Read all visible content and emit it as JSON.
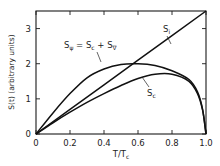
{
  "chart_data": {
    "type": "line",
    "title": "",
    "xlabel": "T/Tc",
    "ylabel": "S(t) (arbitrary units)",
    "xlim": [
      0,
      1.0
    ],
    "ylim": [
      0,
      3.5
    ],
    "grid": false,
    "x_ticks": [
      "0",
      "0.2",
      "0.4",
      "0.6",
      "0.8",
      "1.0"
    ],
    "y_ticks": [
      "0",
      "1",
      "2",
      "3"
    ],
    "series": [
      {
        "name": "Si",
        "x": [
          0,
          0.2,
          0.4,
          0.6,
          0.8,
          1.0
        ],
        "values": [
          0,
          0.7,
          1.4,
          2.1,
          2.8,
          3.5
        ]
      },
      {
        "name": "Sψ = Sc + S∇",
        "x": [
          0,
          0.1,
          0.2,
          0.3,
          0.4,
          0.5,
          0.6,
          0.7,
          0.8,
          0.9,
          0.95,
          0.98,
          1.0
        ],
        "values": [
          0,
          0.6,
          1.15,
          1.6,
          1.85,
          1.98,
          2.0,
          1.95,
          1.8,
          1.55,
          1.2,
          0.7,
          0
        ]
      },
      {
        "name": "Sc",
        "x": [
          0,
          0.1,
          0.2,
          0.3,
          0.4,
          0.5,
          0.6,
          0.7,
          0.8,
          0.9,
          0.95,
          0.98,
          1.0
        ],
        "values": [
          0,
          0.32,
          0.62,
          0.9,
          1.15,
          1.38,
          1.58,
          1.7,
          1.7,
          1.5,
          1.15,
          0.68,
          0
        ]
      }
    ],
    "annotations": [
      {
        "text": "Si",
        "near": [
          0.82,
          2.9
        ]
      },
      {
        "text": "Sψ = Sc + S∇",
        "near": [
          0.3,
          2.4
        ]
      },
      {
        "text": "Sc",
        "near": [
          0.7,
          1.2
        ]
      }
    ]
  },
  "labels": {
    "x_axis": "T/T",
    "x_axis_sub": "c",
    "y_axis": "S(t) (arbitrary units)",
    "ann_si_main": "S",
    "ann_si_sub": "i",
    "ann_sc_main": "S",
    "ann_sc_sub": "c",
    "ann_psi_1": "S",
    "ann_psi_1_sub": "ψ",
    "ann_psi_2": " = S",
    "ann_psi_2_sub": "c",
    "ann_psi_3": " + S",
    "ann_psi_3_sub": "∇"
  }
}
